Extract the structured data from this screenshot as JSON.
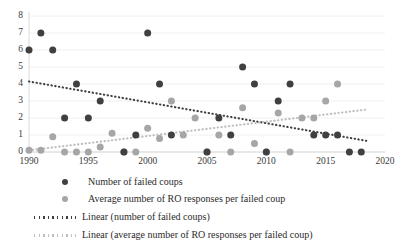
{
  "chart_data": {
    "type": "scatter",
    "title": "",
    "subtitle": "",
    "xlabel": "",
    "ylabel": "",
    "xlim": [
      1990,
      2020
    ],
    "ylim": [
      0,
      8
    ],
    "x_ticks": [
      "1990",
      "1995",
      "2000",
      "2005",
      "2010",
      "2015",
      "2020"
    ],
    "y_ticks": [
      "0",
      "1",
      "2",
      "3",
      "4",
      "5",
      "6",
      "7",
      "8"
    ],
    "grid": "horizontal-light",
    "legend_position": "below",
    "colors": {
      "series_dark": "#404040",
      "series_light": "#a6a6a6",
      "trend_dark": "#404040",
      "trend_light": "#bfbfbf",
      "axis": "#d9d9d9",
      "text": "#2b2b2b"
    },
    "series": [
      {
        "name": "Number of failed coups",
        "marker": "circle",
        "color": "#404040",
        "points": [
          {
            "x": 1990,
            "y": 6
          },
          {
            "x": 1991,
            "y": 7
          },
          {
            "x": 1992,
            "y": 6
          },
          {
            "x": 1993,
            "y": 2
          },
          {
            "x": 1994,
            "y": 4
          },
          {
            "x": 1995,
            "y": 2
          },
          {
            "x": 1996,
            "y": 3
          },
          {
            "x": 1998,
            "y": 0
          },
          {
            "x": 1999,
            "y": 1
          },
          {
            "x": 2000,
            "y": 7
          },
          {
            "x": 2001,
            "y": 4
          },
          {
            "x": 2002,
            "y": 1
          },
          {
            "x": 2005,
            "y": 0
          },
          {
            "x": 2006,
            "y": 2
          },
          {
            "x": 2007,
            "y": 1
          },
          {
            "x": 2008,
            "y": 5
          },
          {
            "x": 2009,
            "y": 4
          },
          {
            "x": 2010,
            "y": 0
          },
          {
            "x": 2011,
            "y": 3
          },
          {
            "x": 2012,
            "y": 4
          },
          {
            "x": 2014,
            "y": 1
          },
          {
            "x": 2015,
            "y": 1
          },
          {
            "x": 2016,
            "y": 1
          },
          {
            "x": 2017,
            "y": 0
          },
          {
            "x": 2018,
            "y": 0
          }
        ]
      },
      {
        "name": "Average number of RO responses per failed coup",
        "marker": "circle",
        "color": "#a6a6a6",
        "points": [
          {
            "x": 1990,
            "y": 0.1
          },
          {
            "x": 1991,
            "y": 0.1
          },
          {
            "x": 1992,
            "y": 0.9
          },
          {
            "x": 1993,
            "y": 0
          },
          {
            "x": 1994,
            "y": 0
          },
          {
            "x": 1995,
            "y": 0
          },
          {
            "x": 1996,
            "y": 0.3
          },
          {
            "x": 1997,
            "y": 1.1
          },
          {
            "x": 1998,
            "y": 0
          },
          {
            "x": 1999,
            "y": 0
          },
          {
            "x": 2000,
            "y": 1.4
          },
          {
            "x": 2001,
            "y": 0.8
          },
          {
            "x": 2002,
            "y": 3
          },
          {
            "x": 2003,
            "y": 1
          },
          {
            "x": 2004,
            "y": 2
          },
          {
            "x": 2005,
            "y": 0
          },
          {
            "x": 2006,
            "y": 1
          },
          {
            "x": 2007,
            "y": 0
          },
          {
            "x": 2008,
            "y": 2.6
          },
          {
            "x": 2009,
            "y": 0.5
          },
          {
            "x": 2010,
            "y": 0
          },
          {
            "x": 2011,
            "y": 2.3
          },
          {
            "x": 2012,
            "y": 0
          },
          {
            "x": 2013,
            "y": 2
          },
          {
            "x": 2014,
            "y": 2
          },
          {
            "x": 2015,
            "y": 3
          },
          {
            "x": 2016,
            "y": 4
          }
        ]
      }
    ],
    "trendlines": [
      {
        "name": "Linear (number of failed coups)",
        "style": "dotted",
        "color": "#404040",
        "x0": 1990,
        "y0": 4.15,
        "x1": 2018.5,
        "y1": 0.65
      },
      {
        "name": "Linear (average number of RO responses per failed coup)",
        "style": "dotted",
        "color": "#bfbfbf",
        "x0": 1990,
        "y0": 0.1,
        "x1": 2018.5,
        "y1": 2.5
      }
    ]
  },
  "legend": {
    "items": [
      {
        "kind": "marker",
        "color": "#404040",
        "label": "Number of failed coups"
      },
      {
        "kind": "marker",
        "color": "#a6a6a6",
        "label": "Average number of RO responses per failed coup"
      },
      {
        "kind": "line",
        "color": "#404040",
        "label": "Linear (number of failed coups)"
      },
      {
        "kind": "line",
        "color": "#bfbfbf",
        "label": "Linear (average number of RO responses per failed coup)"
      }
    ]
  }
}
